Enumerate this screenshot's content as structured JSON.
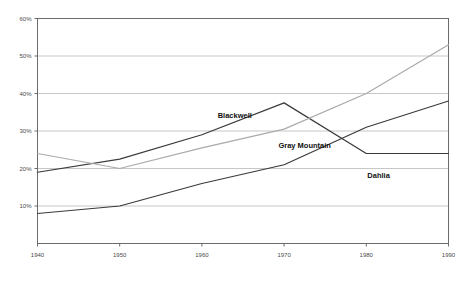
{
  "chart_data": {
    "type": "line",
    "title": "",
    "subtitle": "",
    "xlabel": "",
    "ylabel": "",
    "x": [
      1940,
      1950,
      1960,
      1970,
      1980,
      1990
    ],
    "xticklabels": [
      "1940",
      "1950",
      "1960",
      "1970",
      "1980",
      "1990"
    ],
    "yticklabels": [
      "10%",
      "20%",
      "30%",
      "40%",
      "50%",
      "60%"
    ],
    "yticks": [
      10,
      20,
      30,
      40,
      50,
      60
    ],
    "xlim": [
      1940,
      1990
    ],
    "ylim": [
      0,
      60
    ],
    "grid": "horizontal",
    "legend_position": "inline-annotations",
    "series": [
      {
        "name": "Blackwell",
        "color": "#3a3a3a",
        "values": [
          19,
          22.5,
          29,
          37.5,
          24,
          24
        ],
        "label_x": 1964,
        "label_y": 33.5
      },
      {
        "name": "Gray Mountain",
        "color": "#aaaaaa",
        "values": [
          24,
          20,
          25.5,
          30.5,
          40,
          53
        ],
        "label_x": 1972.5,
        "label_y": 25.5
      },
      {
        "name": "Dahlia",
        "color": "#3a3a3a",
        "values": [
          8,
          10,
          16,
          21,
          31,
          38
        ],
        "label_x": 1981.5,
        "label_y": 17.5
      }
    ]
  },
  "axes": {
    "y_ticks": [
      {
        "label": "60%",
        "value": 60
      },
      {
        "label": "50%",
        "value": 50
      },
      {
        "label": "40%",
        "value": 40
      },
      {
        "label": "30%",
        "value": 30
      },
      {
        "label": "20%",
        "value": 20
      },
      {
        "label": "10%",
        "value": 10
      }
    ],
    "x_ticks": [
      {
        "label": "1940",
        "value": 1940
      },
      {
        "label": "1950",
        "value": 1950
      },
      {
        "label": "1960",
        "value": 1960
      },
      {
        "label": "1970",
        "value": 1970
      },
      {
        "label": "1980",
        "value": 1980
      },
      {
        "label": "1990",
        "value": 1990
      }
    ]
  },
  "style": {
    "background": "#ffffff",
    "plot_border": "#6b6b6b",
    "gridline": "#b9b9b9",
    "tick_text": "#4a4a4a",
    "series_label_text": "#111111"
  }
}
